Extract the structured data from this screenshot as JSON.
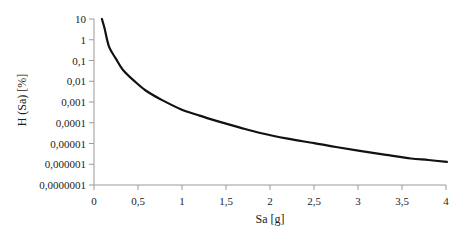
{
  "chart_data": {
    "type": "line",
    "title": "",
    "xlabel": "Sa [g]",
    "ylabel": "H (Sa) [%]",
    "xscale": "linear",
    "yscale": "log",
    "xlim": [
      0,
      4
    ],
    "ylim": [
      1e-07,
      10
    ],
    "grid": false,
    "legend": null,
    "x_ticks": [
      "0",
      "0,5",
      "1",
      "1,5",
      "2",
      "2,5",
      "3",
      "3,5",
      "4"
    ],
    "x_tick_values": [
      0,
      0.5,
      1,
      1.5,
      2,
      2.5,
      3,
      3.5,
      4
    ],
    "y_ticks": [
      "10",
      "1",
      "0,1",
      "0,01",
      "0,001",
      "0,0001",
      "0,00001",
      "0,000001",
      "0,0000001"
    ],
    "y_tick_values": [
      10,
      1,
      0.1,
      0.01,
      0.001,
      0.0001,
      1e-05,
      1e-06,
      1e-07
    ],
    "series": [
      {
        "name": "H (Sa)",
        "color": "#111111",
        "x": [
          0.09,
          0.12,
          0.17,
          0.25,
          0.33,
          0.45,
          0.58,
          0.75,
          0.98,
          1.2,
          1.43,
          1.65,
          1.89,
          2.2,
          2.5,
          2.75,
          3.02,
          3.3,
          3.6,
          3.8,
          4.01
        ],
        "y": [
          10,
          3.5,
          0.47,
          0.12,
          0.035,
          0.011,
          0.0038,
          0.0014,
          0.00046,
          0.00022,
          0.00011,
          6e-05,
          3.2e-05,
          1.7e-05,
          1.05e-05,
          6.8e-06,
          4.4e-06,
          2.9e-06,
          1.9e-06,
          1.6e-06,
          1.3e-06
        ]
      }
    ]
  },
  "axes": {
    "x_title": "Sa [g]",
    "y_title": "H (Sa) [%]"
  }
}
